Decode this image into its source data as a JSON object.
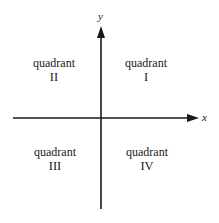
{
  "diagram": {
    "axes": {
      "x_label": "x",
      "y_label": "y",
      "color": "#1a1a1a"
    },
    "quadrants": [
      {
        "id": "I",
        "word": "quadrant",
        "numeral": "I"
      },
      {
        "id": "II",
        "word": "quadrant",
        "numeral": "II"
      },
      {
        "id": "III",
        "word": "quadrant",
        "numeral": "III"
      },
      {
        "id": "IV",
        "word": "quadrant",
        "numeral": "IV"
      }
    ]
  }
}
